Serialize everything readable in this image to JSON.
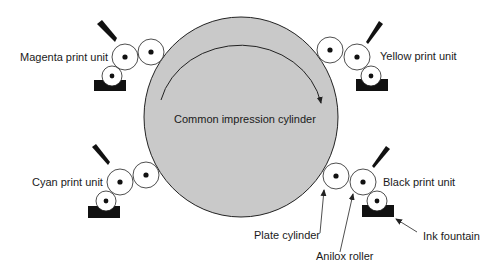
{
  "diagram": {
    "type": "Central impression flexographic press",
    "colors": {
      "cylinder_fill": "#c9c9c9",
      "stroke": "#222222",
      "roller_fill": "#ffffff",
      "fountain": "#111111"
    }
  },
  "labels": {
    "cylinder": "Common impression cylinder",
    "magenta": "Magenta print unit",
    "yellow": "Yellow print unit",
    "cyan": "Cyan print unit",
    "black": "Black print unit",
    "plate_cylinder": "Plate cylinder",
    "anilox_roller": "Anilox roller",
    "ink_fountain": "Ink fountain"
  },
  "print_units": [
    {
      "name": "Magenta print unit",
      "position": "top-left"
    },
    {
      "name": "Yellow print unit",
      "position": "top-right"
    },
    {
      "name": "Cyan print unit",
      "position": "bottom-left"
    },
    {
      "name": "Black print unit",
      "position": "bottom-right"
    }
  ],
  "components": [
    "Plate cylinder",
    "Anilox roller",
    "Ink fountain",
    "Doctor blade"
  ]
}
